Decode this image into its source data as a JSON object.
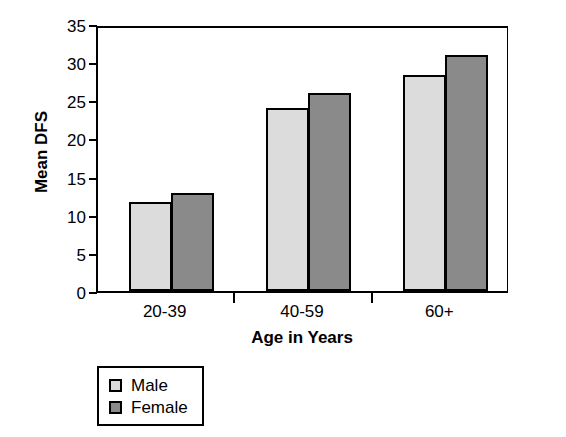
{
  "chart_data": {
    "type": "bar",
    "title": "",
    "xlabel": "Age in Years",
    "ylabel": "Mean DFS",
    "categories": [
      "20-39",
      "40-59",
      "60+"
    ],
    "series": [
      {
        "name": "Male",
        "color": "#dcdcdc",
        "values": [
          11.7,
          24.0,
          28.3
        ]
      },
      {
        "name": "Female",
        "color": "#8a8a8a",
        "values": [
          12.8,
          25.9,
          31.0
        ]
      }
    ],
    "ylim": [
      0,
      35
    ],
    "ytick_step": 5,
    "yticks": [
      0,
      5,
      10,
      15,
      20,
      25,
      30,
      35
    ],
    "ytick_labels": [
      "0",
      "5",
      "10",
      "15",
      "20",
      "25",
      "30",
      "35"
    ],
    "grid": false,
    "legend_position": "below-left-outside",
    "legend_entries": [
      "Male",
      "Female"
    ]
  },
  "axes": {
    "y_title": "Mean DFS",
    "x_title": "Age in Years"
  }
}
